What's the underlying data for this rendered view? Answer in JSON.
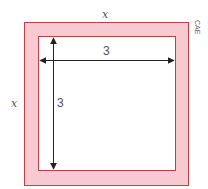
{
  "diagram": {
    "top_cut_text": "",
    "outer_label_top": "x",
    "outer_label_left": "x",
    "inner_label_horizontal": "3",
    "inner_label_vertical": "3",
    "side_tag": "CAE",
    "colors": {
      "border_fill": "#f7c9d0",
      "border_stroke": "#c0404a",
      "arrow": "#222222",
      "inner_fill": "#ffffff"
    }
  }
}
